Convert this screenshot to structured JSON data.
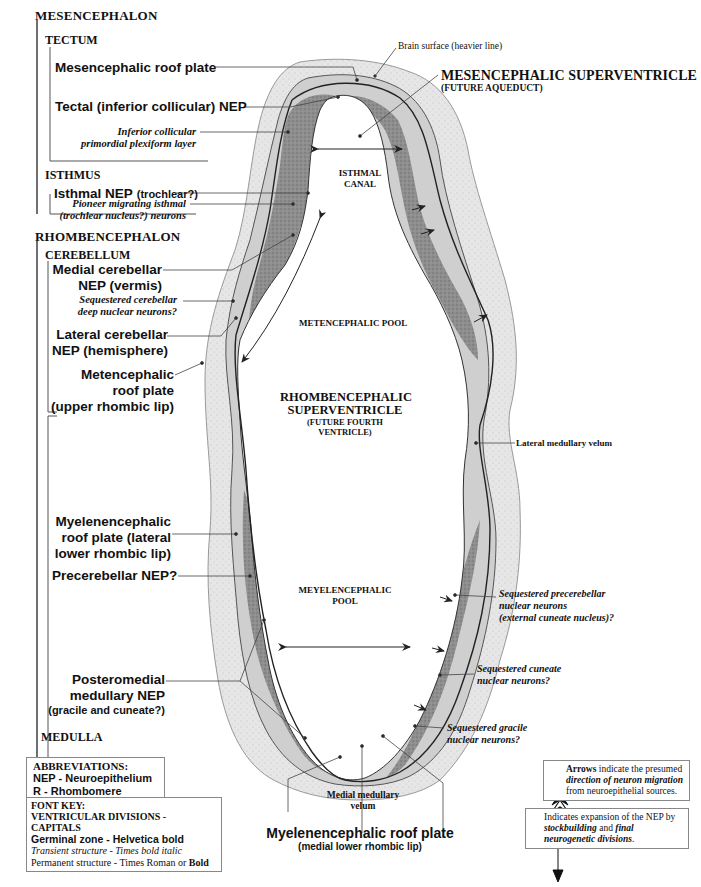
{
  "divisions": {
    "mesencephalon": "MESENCEPHALON",
    "tectum": "TECTUM",
    "isthmus": "ISTHMUS",
    "rhombencephalon": "RHOMBENCEPHALON",
    "cerebellum": "CEREBELLUM",
    "medulla": "MEDULLA"
  },
  "left_labels": {
    "mesencephalic_roof_plate": "Mesencephalic roof plate",
    "tectal_nep": "Tectal (inferior collicular) NEP",
    "inferior_collicular_1": "Inferior collicular",
    "inferior_collicular_2": "primordial plexiform layer",
    "isthmal_nep_main": "Isthmal NEP",
    "isthmal_nep_sub": "(trochlear?)",
    "pioneer_1": "Pioneer migrating isthmal",
    "pioneer_2": "(trochlear nucleus?) neurons",
    "medial_cereb_1": "Medial cerebellar",
    "medial_cereb_2": "NEP (vermis)",
    "sequestered_cereb_1": "Sequestered cerebellar",
    "sequestered_cereb_2": "deep nuclear neurons?",
    "lateral_cereb_1": "Lateral cerebellar",
    "lateral_cereb_2": "NEP (hemisphere)",
    "metenceph_roof_1": "Metencephalic",
    "metenceph_roof_2": "roof plate",
    "metenceph_roof_3": "(upper rhombic lip)",
    "myelenceph_roof_1": "Myelenencephalic",
    "myelenceph_roof_2": "roof plate (lateral",
    "myelenceph_roof_3": "lower rhombic lip)",
    "precerebellar_nep": "Precerebellar NEP?",
    "posteromedial_1": "Posteromedial",
    "posteromedial_2": "medullary NEP",
    "posteromedial_3": "(gracile and cuneate?)"
  },
  "center_labels": {
    "brain_surface": "Brain surface (heavier line)",
    "mes_superventricle": "MESENCEPHALIC SUPERVENTRICLE",
    "future_aqueduct": "(FUTURE AQUEDUCT)",
    "isthmal_canal_1": "ISTHMAL",
    "isthmal_canal_2": "CANAL",
    "metencephalic_pool": "METENCEPHALIC POOL",
    "rhomb_super_1": "RHOMBENCEPHALIC",
    "rhomb_super_2": "SUPERVENTRICLE",
    "rhomb_super_3": "(FUTURE FOURTH",
    "rhomb_super_4": "VENTRICLE)",
    "meyelenceph_pool_1": "MEYELENCEPHALIC",
    "meyelenceph_pool_2": "POOL",
    "medial_velum_1": "Medial medullary",
    "medial_velum_2": "velum",
    "myelen_roof_bottom": "Myelenencephalic roof plate",
    "myelen_roof_bottom_sub": "(medial lower rhombic lip)"
  },
  "right_labels": {
    "lateral_velum": "Lateral medullary velum",
    "seq_precereb_1": "Sequestered precerebellar",
    "seq_precereb_2": "nuclear neurons",
    "seq_precereb_3": "(external cuneate nucleus)?",
    "seq_cuneate_1": "Sequestered cuneate",
    "seq_cuneate_2": "nuclear neurons?",
    "seq_gracile_1": "Sequestered gracile",
    "seq_gracile_2": "nuclear neurons?"
  },
  "abbreviations": {
    "title": "ABBREVIATIONS:",
    "items": [
      "NEP - Neuroepithelium",
      "R - Rhombomere"
    ]
  },
  "font_key": {
    "title": "FONT KEY:",
    "line1": "VENTRICULAR DIVISIONS  -  CAPITALS",
    "line2": "Germinal zone - Helvetica bold",
    "line3": "Transient structure - Times bold italic",
    "line4a": "Permanent structure - Times Roman or ",
    "line4b": "Bold"
  },
  "legend_arrows": {
    "b1": "Arrows",
    "t1": " indicate the presumed ",
    "b2": "direction of neuron migration",
    "t2": " from neuroepithelial sources."
  },
  "legend_expansion": {
    "t1": "Indicates expansion of the NEP by ",
    "b1": "stockbuilding",
    "t2": " and ",
    "b2": "final neurogenetic divisions",
    "t3": "."
  },
  "colors": {
    "outer_tissue": "#e4e4e4",
    "nep_dark": "#8c8c8c",
    "mid_tissue": "#c6c6c6",
    "line": "#333333"
  }
}
